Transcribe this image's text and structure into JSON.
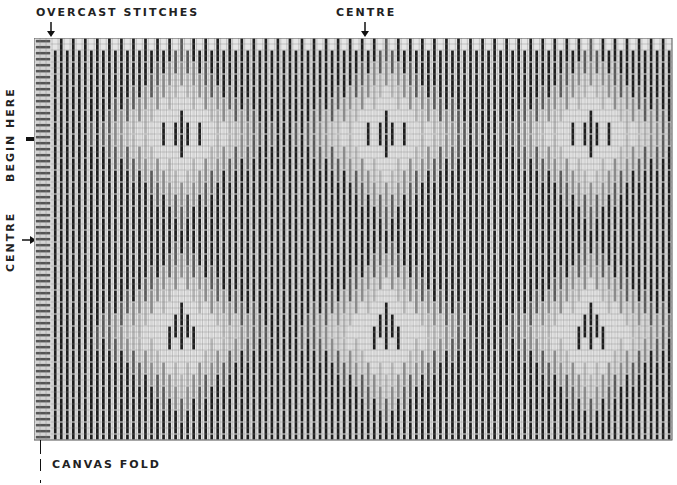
{
  "labels": {
    "overcast_stitches": "OVERCAST STITCHES",
    "centre_top": "CENTRE",
    "begin_here": "BEGIN HERE",
    "centre_left": "CENTRE",
    "canvas_fold": "CANVAS FOLD"
  },
  "grid": {
    "x": 34,
    "y": 38,
    "width": 638,
    "height": 402,
    "cols": 106,
    "rows": 67,
    "cell": 6,
    "overcast_cols": 3
  },
  "colors": {
    "grid_line": "#8a8a8a",
    "background": "#e6e6e6",
    "shade_1_darkest": "#1e1e1e",
    "shade_2_dark": "#5a5a5a",
    "shade_3_mid": "#8c8c8c",
    "shade_4_light": "#b4b4b4",
    "shade_5_lightest": "#d6d6d6",
    "overcast": "#555555"
  },
  "motifs": {
    "medallion_centers_x": [
      24,
      58,
      92
    ],
    "medallion_centers_y": [
      16,
      49
    ],
    "diamond_half_width": 17,
    "diamond_half_height": 16
  }
}
